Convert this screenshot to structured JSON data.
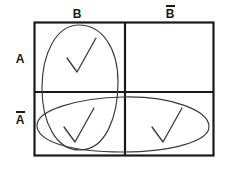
{
  "diagram": {
    "type": "karnaugh-venn-grid",
    "title": "",
    "columns": [
      {
        "id": "B",
        "label": "B",
        "overbar": false
      },
      {
        "id": "notB",
        "label": "B",
        "overbar": true
      }
    ],
    "rows": [
      {
        "id": "A",
        "label": "A",
        "overbar": false
      },
      {
        "id": "notA",
        "label": "A",
        "overbar": true
      }
    ],
    "cells": [
      {
        "id": "A-and-B",
        "row": "A",
        "column": "B",
        "mark": "check",
        "marked": true
      },
      {
        "id": "A-and-notB",
        "row": "A",
        "column": "notB",
        "mark": "",
        "marked": false
      },
      {
        "id": "notA-and-B",
        "row": "notA",
        "column": "B",
        "mark": "check",
        "marked": true
      },
      {
        "id": "notA-and-notB",
        "row": "notA",
        "column": "notB",
        "mark": "check",
        "marked": true
      }
    ],
    "ellipses": [
      {
        "id": "vertical-ellipse",
        "covers": "column-B",
        "orientation": "vertical"
      },
      {
        "id": "horizontal-ellipse",
        "covers": "row-notA",
        "orientation": "horizontal"
      }
    ],
    "colors": {
      "ink": "#1a1a1a",
      "grid": "#1a1a1a",
      "pencil": "#555555",
      "background": "#ffffff"
    }
  }
}
